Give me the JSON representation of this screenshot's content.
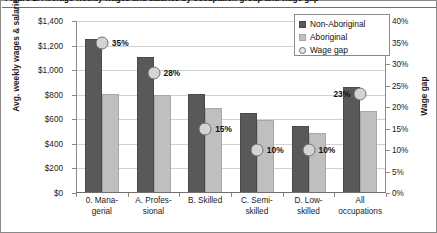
{
  "chart_data": {
    "type": "bar",
    "title": "Figure 1: Average weekly wages and salaries by occupation group and wage gap",
    "categories": [
      "0. Mana-\ngerial",
      "A. Profes-\nsional",
      "B. Skilled",
      "C. Semi-\nskilled",
      "D. Low-\nskilled",
      "All\noccupations"
    ],
    "series": [
      {
        "name": "Non-Aboriginal",
        "values": [
          1250,
          1105,
          805,
          655,
          545,
          860
        ],
        "color": "#595959",
        "axis": "left"
      },
      {
        "name": "Aboriginal",
        "values": [
          810,
          795,
          690,
          595,
          490,
          665
        ],
        "color": "#bfbfbf",
        "axis": "left"
      },
      {
        "name": "Wage gap",
        "values": [
          35,
          28,
          15,
          10,
          10,
          23
        ],
        "color": "#d4d4d4",
        "axis": "right",
        "marker": "circle"
      }
    ],
    "gap_labels": [
      "35%",
      "28%",
      "15%",
      "10%",
      "10%",
      "23%"
    ],
    "xlabel": "",
    "ylabel": "Avg. weekly wages & salaries",
    "ylabel_right": "Wage gap",
    "ylim": [
      0,
      1400
    ],
    "ylim_right": [
      0,
      40
    ],
    "yticks_left": [
      "$0",
      "$200",
      "$400",
      "$600",
      "$800",
      "$1,000",
      "$1,200",
      "$1,400"
    ],
    "yticks_right": [
      "0%",
      "5%",
      "10%",
      "15%",
      "20%",
      "25%",
      "30%",
      "35%",
      "40%"
    ],
    "grid": true,
    "legend_position": "top-right",
    "legend": [
      "Non-Aboriginal",
      "Aboriginal",
      "Wage gap"
    ]
  }
}
